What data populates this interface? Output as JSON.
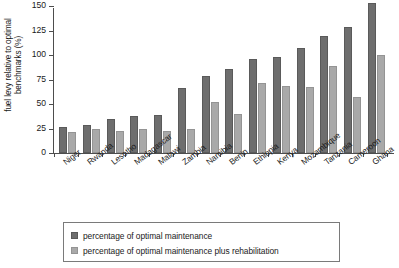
{
  "chart_data": {
    "type": "bar",
    "title": "",
    "xlabel": "",
    "ylabel": "fuel levy relative to optimal benchmarks (%)",
    "ylim": [
      0,
      150
    ],
    "yticks": [
      0,
      25,
      50,
      75,
      100,
      125,
      150
    ],
    "grid": false,
    "legend_position": "below-plot",
    "categories": [
      "Niger",
      "Rwanda",
      "Lesotho",
      "Madagascar",
      "Malawi",
      "Zambia",
      "Namibia",
      "Benin",
      "Ethiopia",
      "Kenya",
      "Mozambique",
      "Tanzania",
      "Cameroon",
      "Ghana"
    ],
    "series": [
      {
        "name": "percentage of optimal maintenance",
        "color": "#6e6e6e",
        "values": [
          27,
          29,
          35,
          38,
          39,
          66,
          79,
          86,
          96,
          98,
          107,
          119,
          129,
          153
        ]
      },
      {
        "name": "percentage of optimal maintenance plus rehabilitation",
        "color": "#a9a9a9",
        "values": [
          21,
          24,
          22,
          25,
          22,
          25,
          52,
          40,
          71,
          68,
          67,
          89,
          57,
          100
        ]
      }
    ]
  },
  "legend": {
    "items": [
      {
        "label": "percentage of optimal maintenance",
        "swatch": "dark-swatch"
      },
      {
        "label": "percentage of optimal maintenance plus rehabilitation",
        "swatch": "light-swatch"
      }
    ]
  }
}
